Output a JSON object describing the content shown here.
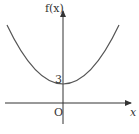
{
  "diagram": {
    "type": "function-graph",
    "function_label": "f(x)",
    "x_axis_label": "x",
    "origin_label": "O",
    "y_intercept_label": "3",
    "curve": "parabola opening upward with vertex at (0, 3)",
    "colors": {
      "curve": "#555555",
      "axes": "#333333"
    }
  }
}
